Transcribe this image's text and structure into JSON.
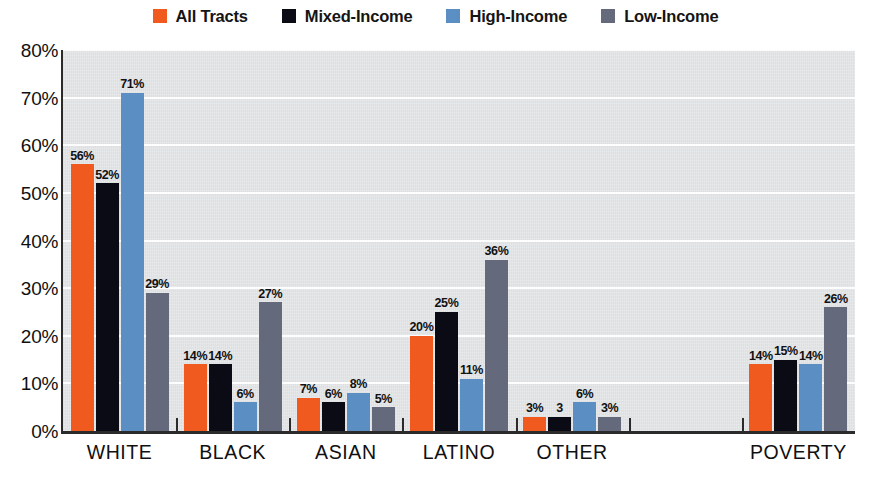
{
  "legend": {
    "position": "top-center",
    "items": [
      {
        "label": "All Tracts",
        "color": "#f05a1e",
        "key": "all_tracts"
      },
      {
        "label": "Mixed-Income",
        "color": "#0b0b15",
        "key": "mixed_income"
      },
      {
        "label": "High-Income",
        "color": "#5b8fc4",
        "key": "high_income"
      },
      {
        "label": "Low-Income",
        "color": "#646a7c",
        "key": "low_income"
      }
    ]
  },
  "axis": {
    "y_ticks": [
      "0%",
      "10%",
      "20%",
      "30%",
      "40%",
      "50%",
      "60%",
      "70%",
      "80%"
    ],
    "x_labels": [
      "WHITE",
      "BLACK",
      "ASIAN",
      "LATINO",
      "OTHER",
      "",
      "POVERTY"
    ]
  },
  "chart_data": {
    "type": "bar",
    "title": "",
    "subtitle": "",
    "xlabel": "",
    "ylabel": "",
    "ylim": [
      0,
      80
    ],
    "ytick_step": 10,
    "ytick_format": "percent",
    "grid": "horizontal",
    "legend_position": "top-center",
    "categories": [
      "WHITE",
      "BLACK",
      "ASIAN",
      "LATINO",
      "OTHER",
      "",
      "POVERTY"
    ],
    "series": [
      {
        "name": "All Tracts",
        "color": "#f05a1e",
        "values": [
          56,
          14,
          7,
          20,
          3,
          null,
          14
        ]
      },
      {
        "name": "Mixed-Income",
        "color": "#0b0b15",
        "values": [
          52,
          14,
          6,
          25,
          3,
          null,
          15
        ]
      },
      {
        "name": "High-Income",
        "color": "#5b8fc4",
        "values": [
          71,
          6,
          8,
          11,
          6,
          null,
          14
        ]
      },
      {
        "name": "Low-Income",
        "color": "#646a7c",
        "values": [
          29,
          27,
          5,
          36,
          3,
          null,
          26
        ]
      }
    ],
    "data_labels": {
      "WHITE": [
        "56%",
        "52%",
        "71%",
        "29%"
      ],
      "BLACK": [
        "14%",
        "14%",
        "6%",
        "27%"
      ],
      "ASIAN": [
        "7%",
        "6%",
        "8%",
        "5%"
      ],
      "LATINO": [
        "20%",
        "25%",
        "11%",
        "36%"
      ],
      "OTHER": [
        "3%",
        "3",
        "6%",
        "3%",
        "3%"
      ],
      "POVERTY": [
        "14%",
        "15%",
        "14%",
        "26%"
      ]
    }
  },
  "colors": {
    "plot_background": "#e2e4e5",
    "gridline": "#fdfdfd",
    "axis": "#2b2b2b",
    "page_background": "#ffffff",
    "text": "#101010"
  }
}
